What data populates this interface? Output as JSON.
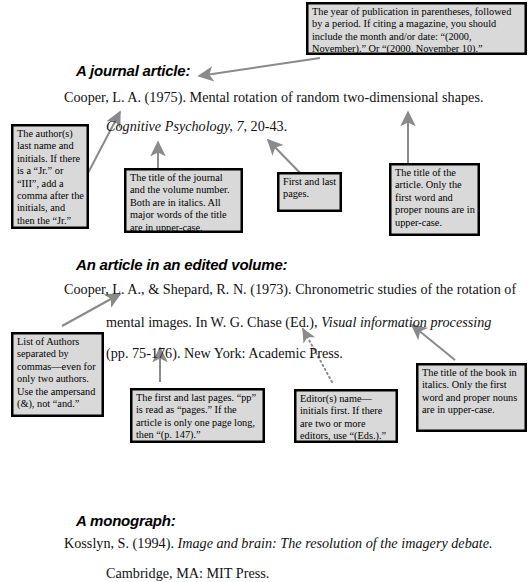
{
  "page": {
    "accent_gray": "#808080",
    "box_fill": "#d9d9d9",
    "box_border": "#000000"
  },
  "sections": [
    {
      "heading": "A journal article:",
      "lines": [
        {
          "parts": [
            {
              "text": "Cooper, L. A.  (1975).  Mental rotation of random two-dimensional shapes.",
              "italic": false
            }
          ]
        },
        {
          "parts": [
            {
              "text": "Cognitive Psychology,  7",
              "italic": true
            },
            {
              "text": ", 20-43.",
              "italic": false
            }
          ]
        }
      ]
    },
    {
      "heading": "An article in an edited volume:",
      "lines": [
        {
          "parts": [
            {
              "text": "Cooper, L. A., & Shepard, R. N. (1973).  Chronometric studies of the rotation of",
              "italic": false
            }
          ]
        },
        {
          "parts": [
            {
              "text": "mental images.  In W. G. Chase (Ed.), ",
              "italic": false
            },
            {
              "text": "Visual information processing",
              "italic": true
            }
          ]
        },
        {
          "parts": [
            {
              "text": "(pp. 75-176).  New York: Academic Press.",
              "italic": false
            }
          ]
        }
      ]
    },
    {
      "heading": "A monograph:",
      "lines": [
        {
          "parts": [
            {
              "text": "Kosslyn, S.  (1994).  ",
              "italic": false
            },
            {
              "text": "Image and brain:  The resolution of the imagery debate.",
              "italic": true
            }
          ]
        },
        {
          "parts": [
            {
              "text": "Cambridge, MA:  MIT Press.",
              "italic": false
            }
          ]
        }
      ]
    }
  ],
  "callouts": {
    "year_of_publication": "The year of publication in parentheses, followed by a period.  If citing a magazine, you should include the month and/or date:  “(2000, November).”  Or “(2000, November 10).”",
    "author_last_name": "The author(s) last name and initials.  If there is a “Jr.” or “III”, add a comma after the initials, and then the “Jr.”",
    "journal_title": "The title of the journal and the volume number.  Both are in italics.  All major words of the title are in upper-case.",
    "first_last_pages": "First and last pages.",
    "article_title": "The title of the article.  Only the first word and proper nouns are in upper-case.",
    "list_of_authors": "List of Authors separated by commas—even for only two authors.  Use the ampersand (&), not “and.”",
    "first_and_last_pages_detail": "The first and last pages.  “pp” is read as “pages.”  If the article is only one page long, then “(p. 147).”",
    "editors_name": "Editor(s) name—initials first.  If there are two or more editors, use  “(Eds.).”",
    "book_title": "The title of the book in italics.  Only the first word and proper nouns are in upper-case."
  }
}
